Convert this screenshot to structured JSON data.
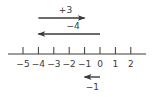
{
  "diagram": {
    "type": "number-line",
    "ticks": [
      -5,
      -4,
      -3,
      -2,
      -1,
      0,
      1,
      2
    ],
    "tick_labels": [
      "−5",
      "−4",
      "−3",
      "−2",
      "−1",
      "0",
      "1",
      "2"
    ],
    "arrows": [
      {
        "label": "+3",
        "from": -4,
        "to": -1,
        "direction": "right"
      },
      {
        "label": "−4",
        "from": 0,
        "to": -4,
        "direction": "left"
      },
      {
        "label": "−1",
        "from": 0,
        "to": -1,
        "direction": "left"
      }
    ],
    "colors": {
      "ink": "#3a3a3a"
    }
  }
}
